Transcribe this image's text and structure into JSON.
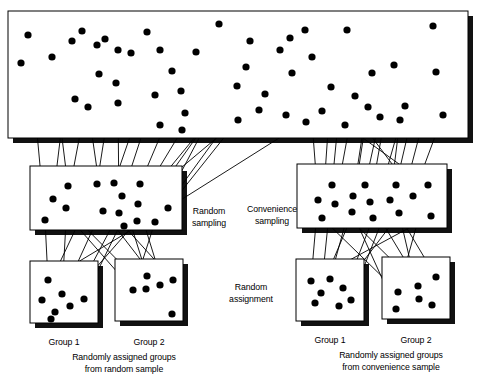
{
  "diagram": {
    "colors": {
      "ink": "#000000",
      "paper": "#ffffff",
      "shadow": "#111111"
    },
    "labels": {
      "random_sampling": "Random\nsampling",
      "convenience_sampling": "Convenience\nsampling",
      "random_assignment": "Random\nassignment",
      "left_group_1": "Group 1",
      "left_group_2": "Group 2",
      "right_group_1": "Group 1",
      "right_group_2": "Group 2",
      "left_caption": "Randomly assigned groups\nfrom random sample",
      "right_caption": "Randomly assigned groups\nfrom convenience sample"
    },
    "boxes": {
      "population": {
        "x": 8,
        "y": 11,
        "w": 460,
        "h": 127,
        "shadow": 5
      },
      "sample_random": {
        "x": 30,
        "y": 166,
        "w": 152,
        "h": 64,
        "shadow": 5
      },
      "sample_convenience": {
        "x": 297,
        "y": 164,
        "w": 150,
        "h": 64,
        "shadow": 5
      },
      "group_left_1": {
        "x": 30,
        "y": 261,
        "w": 68,
        "h": 62,
        "shadow": 5
      },
      "group_left_2": {
        "x": 115,
        "y": 259,
        "w": 68,
        "h": 62,
        "shadow": 5
      },
      "group_right_1": {
        "x": 296,
        "y": 259,
        "w": 68,
        "h": 62,
        "shadow": 5
      },
      "group_right_2": {
        "x": 382,
        "y": 257,
        "w": 68,
        "h": 62,
        "shadow": 5
      }
    },
    "label_positions": {
      "random_sampling": {
        "x": 185,
        "y": 205,
        "w": 48
      },
      "convenience_sampling": {
        "x": 243,
        "y": 203,
        "w": 58
      },
      "random_assignment": {
        "x": 213,
        "y": 281,
        "w": 76
      },
      "left_group_1": {
        "x": 35,
        "y": 336,
        "w": 58
      },
      "left_group_2": {
        "x": 120,
        "y": 336,
        "w": 58
      },
      "right_group_1": {
        "x": 301,
        "y": 334,
        "w": 58
      },
      "right_group_2": {
        "x": 387,
        "y": 334,
        "w": 58
      },
      "left_caption": {
        "x": 56,
        "y": 351,
        "w": 136
      },
      "right_caption": {
        "x": 318,
        "y": 349,
        "w": 146
      }
    },
    "dot_radius": 3.6,
    "arrow_head": 4.2
  },
  "chart_data": {
    "type": "scatter",
    "population_dots": [
      [
        21,
        63
      ],
      [
        28,
        35
      ],
      [
        72,
        41
      ],
      [
        52,
        57
      ],
      [
        82,
        31
      ],
      [
        97,
        45
      ],
      [
        105,
        39
      ],
      [
        118,
        50
      ],
      [
        99,
        74
      ],
      [
        75,
        99
      ],
      [
        131,
        53
      ],
      [
        116,
        83
      ],
      [
        88,
        107
      ],
      [
        160,
        50
      ],
      [
        172,
        71
      ],
      [
        155,
        95
      ],
      [
        181,
        91
      ],
      [
        118,
        103
      ],
      [
        185,
        113
      ],
      [
        196,
        52
      ],
      [
        160,
        125
      ],
      [
        182,
        130
      ],
      [
        238,
        120
      ],
      [
        246,
        67
      ],
      [
        250,
        41
      ],
      [
        280,
        50
      ],
      [
        237,
        86
      ],
      [
        265,
        94
      ],
      [
        290,
        38
      ],
      [
        292,
        73
      ],
      [
        305,
        30
      ],
      [
        312,
        57
      ],
      [
        322,
        111
      ],
      [
        306,
        122
      ],
      [
        331,
        87
      ],
      [
        345,
        125
      ],
      [
        355,
        96
      ],
      [
        372,
        73
      ],
      [
        368,
        107
      ],
      [
        380,
        117
      ],
      [
        394,
        65
      ],
      [
        405,
        106
      ],
      [
        400,
        120
      ],
      [
        433,
        26
      ],
      [
        436,
        72
      ],
      [
        443,
        115
      ],
      [
        147,
        32
      ],
      [
        219,
        24
      ],
      [
        259,
        110
      ],
      [
        286,
        115
      ],
      [
        347,
        30
      ]
    ],
    "random_sample_dots": [
      [
        45,
        220
      ],
      [
        53,
        199
      ],
      [
        68,
        186
      ],
      [
        66,
        208
      ],
      [
        97,
        184
      ],
      [
        103,
        211
      ],
      [
        114,
        183
      ],
      [
        122,
        196
      ],
      [
        119,
        213
      ],
      [
        124,
        226
      ],
      [
        140,
        184
      ],
      [
        138,
        204
      ],
      [
        137,
        221
      ],
      [
        155,
        222
      ],
      [
        168,
        208
      ]
    ],
    "convenience_sample_dots": [
      [
        318,
        200
      ],
      [
        322,
        218
      ],
      [
        332,
        185
      ],
      [
        335,
        204
      ],
      [
        353,
        196
      ],
      [
        352,
        212
      ],
      [
        365,
        185
      ],
      [
        370,
        202
      ],
      [
        373,
        218
      ],
      [
        390,
        200
      ],
      [
        396,
        185
      ],
      [
        399,
        213
      ],
      [
        413,
        196
      ],
      [
        428,
        185
      ],
      [
        431,
        216
      ]
    ],
    "left_group1_dots": [
      [
        48,
        280
      ],
      [
        62,
        294
      ],
      [
        42,
        300
      ],
      [
        55,
        312
      ],
      [
        70,
        306
      ],
      [
        84,
        299
      ],
      [
        51,
        319
      ]
    ],
    "left_group2_dots": [
      [
        133,
        290
      ],
      [
        146,
        289
      ],
      [
        160,
        285
      ],
      [
        147,
        276
      ],
      [
        173,
        280
      ],
      [
        172,
        314
      ]
    ],
    "right_group1_dots": [
      [
        311,
        281
      ],
      [
        321,
        293
      ],
      [
        330,
        279
      ],
      [
        315,
        303
      ],
      [
        339,
        306
      ],
      [
        351,
        300
      ],
      [
        343,
        288
      ]
    ],
    "right_group2_dots": [
      [
        398,
        292
      ],
      [
        418,
        286
      ],
      [
        396,
        309
      ],
      [
        432,
        305
      ],
      [
        436,
        277
      ],
      [
        419,
        299
      ]
    ]
  }
}
